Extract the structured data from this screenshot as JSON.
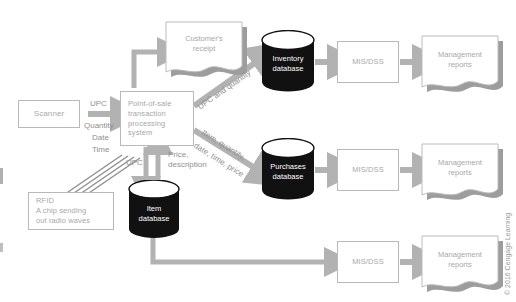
{
  "diagram": {
    "colors": {
      "arrow": "#b2b2b2",
      "node_border": "#b9b9b9",
      "node_shadow": "#9d9d9d",
      "node_text": "#a8a8a8",
      "label_text": "#8f8f8f",
      "database_fill": "#111111",
      "database_top": "#ffffff",
      "database_text": "#ffffff",
      "background": "#ffffff"
    },
    "nodes": {
      "scanner": {
        "label": "Scanner",
        "shape": "process"
      },
      "rfid": {
        "label": "RFID\nA chip sending\nout radio waves",
        "shape": "process"
      },
      "pos": {
        "label": "Point-of-sale\ntransaction\nprocessing\nsystem",
        "shape": "process"
      },
      "receipt": {
        "label": "Customer's\nreceipt",
        "shape": "document"
      },
      "item_db": {
        "label": "Item\ndatabase",
        "shape": "database"
      },
      "inventory_db": {
        "label": "Inventory\ndatabase",
        "shape": "database"
      },
      "purchases_db": {
        "label": "Purchases\ndatabase",
        "shape": "database"
      },
      "mis_top": {
        "label": "MIS/DSS",
        "shape": "process"
      },
      "mis_middle": {
        "label": "MIS/DSS",
        "shape": "process"
      },
      "mis_bottom": {
        "label": "MIS/DSS",
        "shape": "process"
      },
      "reports_top": {
        "label": "Management\nreports",
        "shape": "document"
      },
      "reports_middle": {
        "label": "Management\nreports",
        "shape": "document"
      },
      "reports_bottom": {
        "label": "Management\nreports",
        "shape": "document"
      }
    },
    "flow_labels": {
      "upc": "UPC",
      "quantity": "Quantity",
      "date": "Date",
      "time": "Time",
      "upc_to_item_db": "UPC",
      "price_description": "Price,\ndescription",
      "upc_and_quantity": "UPC and quantity",
      "item_quantity_date_time_price_line1": "Item, quantity,",
      "item_quantity_date_time_price_line2": "date, time, price"
    },
    "credit": "© 2016 Cengage Learning"
  }
}
